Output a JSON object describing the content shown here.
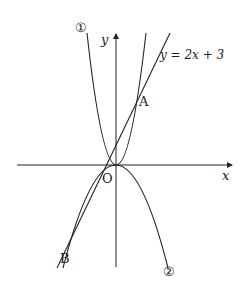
{
  "diagram": {
    "axes": {
      "x_label": "x",
      "y_label": "y",
      "origin_label": "O"
    },
    "curves": {
      "parabola_1": {
        "marker": "①",
        "opens": "up"
      },
      "parabola_2": {
        "marker": "②",
        "opens": "down"
      },
      "line": {
        "equation_label": "y = 2x + 3"
      }
    },
    "points": {
      "A": {
        "label": "A"
      },
      "B": {
        "label": "B"
      }
    },
    "colors": {
      "stroke": "#222222",
      "background": "#ffffff"
    }
  }
}
